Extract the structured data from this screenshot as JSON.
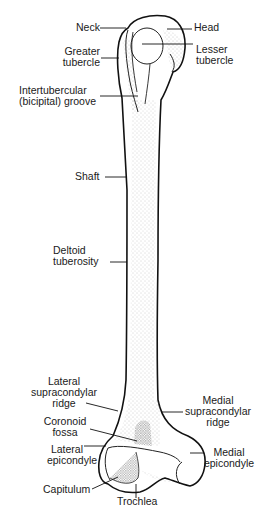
{
  "diagram": {
    "colors": {
      "outline": "#111111",
      "stipple": "#9a9a9a",
      "shade_dark": "#444444",
      "background": "#ffffff"
    },
    "labels": {
      "neck": "Neck",
      "head": "Head",
      "greater_tubercle_1": "Greater",
      "greater_tubercle_2": "tubercle",
      "lesser_tubercle_1": "Lesser",
      "lesser_tubercle_2": "tubercle",
      "intertubercular_1": "Intertubercular",
      "intertubercular_2": "(bicipital) groove",
      "shaft": "Shaft",
      "deltoid_1": "Deltoid",
      "deltoid_2": "tuberosity",
      "lat_supra_1": "Lateral",
      "lat_supra_2": "supracondylar",
      "lat_supra_3": "ridge",
      "med_supra_1": "Medial",
      "med_supra_2": "supracondylar",
      "med_supra_3": "ridge",
      "coronoid_1": "Coronoid",
      "coronoid_2": "fossa",
      "lat_epi_1": "Lateral",
      "lat_epi_2": "epicondyle",
      "med_epi_1": "Medial",
      "med_epi_2": "epicondyle",
      "capitulum": "Capitulum",
      "trochlea": "Trochlea"
    }
  }
}
